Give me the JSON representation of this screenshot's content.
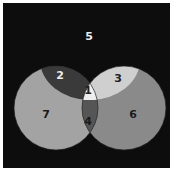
{
  "diagram": {
    "type": "venn",
    "regions": [
      {
        "id": "1",
        "label": "1",
        "color": "#eeeeee",
        "text_color": "#222222"
      },
      {
        "id": "2",
        "label": "2",
        "color": "#3a3a3a",
        "text_color": "#eeeeee"
      },
      {
        "id": "3",
        "label": "3",
        "color": "#cfcfcf",
        "text_color": "#222222"
      },
      {
        "id": "4",
        "label": "4",
        "color": "#555555",
        "text_color": "#1a1a1a"
      },
      {
        "id": "5",
        "label": "5",
        "color": "#0d0d0d",
        "text_color": "#eeeeee"
      },
      {
        "id": "6",
        "label": "6",
        "color": "#8a8a8a",
        "text_color": "#1a1a1a"
      },
      {
        "id": "7",
        "label": "7",
        "color": "#a3a3a3",
        "text_color": "#1a1a1a"
      }
    ]
  }
}
